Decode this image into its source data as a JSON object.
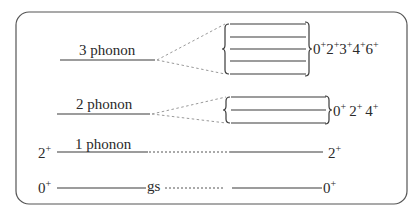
{
  "diagram": {
    "levels": [
      {
        "id": "3phonon",
        "label": "3 phonon",
        "spins": [
          "0",
          "2",
          "3",
          "4",
          "6"
        ],
        "parity": "+",
        "multiplet_lines": 5
      },
      {
        "id": "2phonon",
        "label": "2 phonon",
        "spins": [
          "0",
          "2",
          "4"
        ],
        "parity": "+",
        "multiplet_lines": 3
      },
      {
        "id": "1phonon",
        "label": "1 phonon",
        "left_spin": "2",
        "right_spin": "2",
        "parity": "+"
      },
      {
        "id": "gs",
        "label": "gs",
        "left_spin": "0",
        "right_spin": "0",
        "parity": "+"
      }
    ],
    "text": {
      "three_phonon": "3 phonon",
      "two_phonon": "2 phonon",
      "one_phonon": "1 phonon",
      "gs": "gs",
      "plus": "+",
      "s0": "0",
      "s2": "2",
      "s3": "3",
      "s4": "4",
      "s6": "6"
    },
    "colors": {
      "line": "#3a3a3a",
      "dashed": "#9a9a9a",
      "text": "#2a2a2a",
      "frame": "#555555"
    }
  }
}
